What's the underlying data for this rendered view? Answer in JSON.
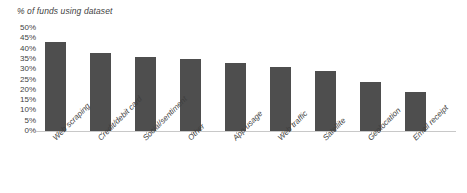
{
  "chart_data": {
    "type": "bar",
    "title": "% of funds using dataset",
    "xlabel": "",
    "ylabel": "",
    "ylim": [
      0,
      50
    ],
    "ytick_step": 5,
    "grid": false,
    "legend": "none",
    "bar_color": "#4e4e4e",
    "axis_color": "#c8c8c8",
    "text_color": "#3f3f3f",
    "categories": [
      "Web scraping",
      "Credit/debit card",
      "Social/sentiment",
      "Other",
      "App usage",
      "Web traffic",
      "Satellite",
      "Geolocation",
      "Email receipt"
    ],
    "values": [
      43,
      38,
      36,
      35,
      33,
      31,
      29,
      24,
      19
    ],
    "ytick_labels": [
      "50%",
      "45%",
      "40%",
      "35%",
      "30%",
      "25%",
      "20%",
      "15%",
      "10%",
      "5%",
      "0%"
    ],
    "ytick_values": [
      50,
      45,
      40,
      35,
      30,
      25,
      20,
      15,
      10,
      5,
      0
    ]
  }
}
